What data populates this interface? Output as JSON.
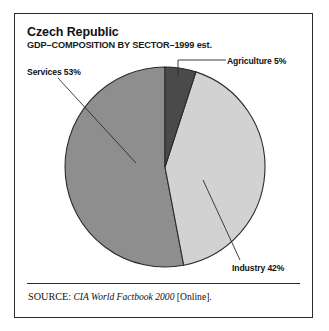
{
  "figure": {
    "title": "Czech Republic",
    "subtitle": "GDP–COMPOSITION BY SECTOR–1999 est.",
    "source": {
      "kicker": "SOURCE:",
      "title": "CIA World Factbook 2000",
      "suffix": "[Online]."
    }
  },
  "labels": {
    "services": "Services 53%",
    "agriculture": "Agriculture 5%",
    "industry": "Industry 42%"
  },
  "chart_data": {
    "type": "pie",
    "title": "Czech Republic",
    "subtitle": "GDP–COMPOSITION BY SECTOR–1999 est.",
    "categories": [
      "Agriculture",
      "Industry",
      "Services"
    ],
    "values": [
      5,
      42,
      53
    ],
    "units": "percent",
    "total": 100,
    "start_angle_deg": 0,
    "direction": "clockwise",
    "legend": "none",
    "labels_position": "outside-with-leader-lines",
    "grid": false,
    "slices": [
      {
        "name": "Agriculture",
        "value": 5,
        "label": "Agriculture 5%",
        "color": "#4a4a4a"
      },
      {
        "name": "Industry",
        "value": 42,
        "label": "Industry 42%",
        "color": "#d2d2d2"
      },
      {
        "name": "Services",
        "value": 53,
        "label": "Services 53%",
        "color": "#8e8e8e"
      }
    ]
  }
}
